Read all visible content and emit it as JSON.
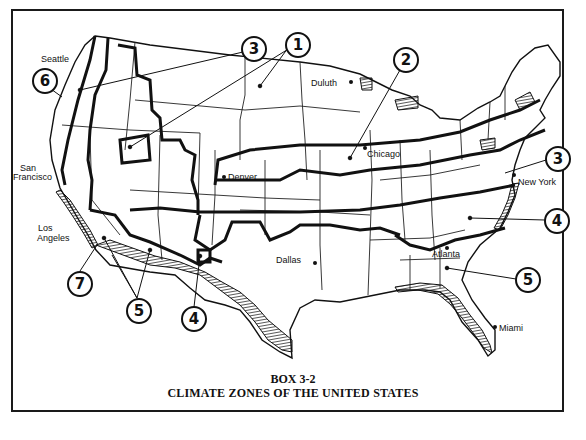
{
  "figure": {
    "box_label": "BOX 3-2",
    "title": "CLIMATE ZONES OF THE UNITED STATES"
  },
  "cities": [
    {
      "name": "Seattle",
      "x": 41,
      "y": 55
    },
    {
      "name": "San",
      "x": 20,
      "y": 164
    },
    {
      "name": "Francisco",
      "x": 13,
      "y": 173
    },
    {
      "name": "Los",
      "x": 38,
      "y": 224
    },
    {
      "name": "Angeles",
      "x": 37,
      "y": 234
    },
    {
      "name": "Denver",
      "x": 228,
      "y": 173
    },
    {
      "name": "Duluth",
      "x": 311,
      "y": 79
    },
    {
      "name": "Chicago",
      "x": 367,
      "y": 150
    },
    {
      "name": "New York",
      "x": 518,
      "y": 178
    },
    {
      "name": "Dallas",
      "x": 276,
      "y": 256
    },
    {
      "name": "Atlanta",
      "x": 432,
      "y": 250
    },
    {
      "name": "Miami",
      "x": 499,
      "y": 324
    }
  ],
  "zones": [
    {
      "number": "1",
      "x": 285,
      "y": 32
    },
    {
      "number": "2",
      "x": 393,
      "y": 47
    },
    {
      "number": "3",
      "x": 241,
      "y": 36
    },
    {
      "number": "3",
      "x": 545,
      "y": 146
    },
    {
      "number": "4",
      "x": 544,
      "y": 208
    },
    {
      "number": "4",
      "x": 181,
      "y": 306
    },
    {
      "number": "5",
      "x": 126,
      "y": 298
    },
    {
      "number": "5",
      "x": 515,
      "y": 267
    },
    {
      "number": "6",
      "x": 32,
      "y": 68
    },
    {
      "number": "7",
      "x": 67,
      "y": 271
    }
  ]
}
